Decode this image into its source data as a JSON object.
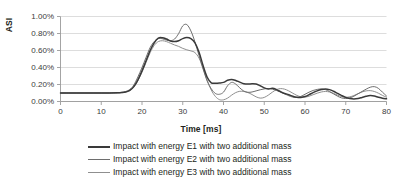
{
  "chart_data": {
    "type": "line",
    "title": "",
    "xlabel": "Time [ms]",
    "ylabel": "ASI",
    "xlim": [
      0,
      80
    ],
    "ylim": [
      0,
      0.01
    ],
    "xticks": [
      "0",
      "10",
      "20",
      "30",
      "40",
      "50",
      "60",
      "70",
      "80"
    ],
    "xtick_values": [
      0,
      10,
      20,
      30,
      40,
      50,
      60,
      70,
      80
    ],
    "yticks": [
      "0.00%",
      "0.20%",
      "0.40%",
      "0.60%",
      "0.80%",
      "1.00%"
    ],
    "ytick_values": [
      0.0,
      0.002,
      0.004,
      0.006,
      0.008,
      0.01
    ],
    "grid": "horizontal",
    "legend_position": "bottom",
    "x": [
      0,
      2,
      4,
      6,
      8,
      10,
      12,
      14,
      15,
      16,
      17,
      18,
      19,
      20,
      21,
      22,
      23,
      24,
      25,
      26,
      27,
      28,
      29,
      30,
      31,
      32,
      33,
      34,
      35,
      36,
      37,
      38,
      39,
      40,
      41,
      42,
      43,
      44,
      45,
      46,
      47,
      48,
      49,
      50,
      51,
      52,
      53,
      54,
      55,
      56,
      57,
      58,
      59,
      60,
      61,
      62,
      63,
      64,
      65,
      66,
      67,
      68,
      69,
      70,
      71,
      72,
      73,
      74,
      75,
      76,
      77,
      78,
      79,
      80
    ],
    "series": [
      {
        "name": "Impact with energy E1 with two additional mass",
        "color": "#3a3a3a",
        "values": [
          0.001,
          0.001,
          0.001,
          0.001,
          0.001,
          0.001,
          0.001,
          0.00102,
          0.00105,
          0.00112,
          0.0013,
          0.00175,
          0.00255,
          0.0036,
          0.0048,
          0.006,
          0.0069,
          0.00745,
          0.0075,
          0.00735,
          0.00712,
          0.00705,
          0.00715,
          0.0074,
          0.00752,
          0.0074,
          0.0069,
          0.0058,
          0.0042,
          0.00285,
          0.0022,
          0.00215,
          0.00218,
          0.00225,
          0.0025,
          0.0026,
          0.00248,
          0.00228,
          0.0021,
          0.00205,
          0.00208,
          0.00205,
          0.00185,
          0.0016,
          0.00148,
          0.00155,
          0.0014,
          0.00115,
          0.00095,
          0.0008,
          0.00062,
          0.0005,
          0.00048,
          0.00058,
          0.0008,
          0.00105,
          0.00125,
          0.0014,
          0.00148,
          0.0014,
          0.0012,
          0.00095,
          0.0007,
          0.00048,
          0.00035,
          0.0003,
          0.00035,
          0.00048,
          0.00062,
          0.0007,
          0.00065,
          0.0005,
          0.00038,
          0.00032
        ]
      },
      {
        "name": "Impact with energy E2 with two additional mass",
        "color": "#6e6e6e",
        "values": [
          0.001,
          0.001,
          0.001,
          0.001,
          0.001,
          0.001,
          0.001,
          0.00103,
          0.00108,
          0.00118,
          0.0014,
          0.00195,
          0.0029,
          0.004,
          0.0052,
          0.00635,
          0.00705,
          0.0074,
          0.00738,
          0.00722,
          0.00715,
          0.00735,
          0.008,
          0.0089,
          0.00905,
          0.0083,
          0.007,
          0.0054,
          0.0038,
          0.0024,
          0.0015,
          0.00095,
          0.00085,
          0.0011,
          0.00185,
          0.00225,
          0.00205,
          0.0016,
          0.00122,
          0.00108,
          0.00112,
          0.00125,
          0.00138,
          0.00148,
          0.00152,
          0.00145,
          0.0013,
          0.00112,
          0.0009,
          0.00068,
          0.00052,
          0.00048,
          0.0006,
          0.00085,
          0.0011,
          0.0013,
          0.00142,
          0.00148,
          0.0014,
          0.00118,
          0.0009,
          0.00062,
          0.00042,
          0.00035,
          0.00042,
          0.00062,
          0.0009,
          0.00118,
          0.00145,
          0.00168,
          0.00175,
          0.00155,
          0.0011,
          0.00065
        ]
      },
      {
        "name": "Impact with energy E3 with two additional mass",
        "color": "#8f8f8f",
        "values": [
          0.001,
          0.001,
          0.001,
          0.001,
          0.001,
          0.001,
          0.001,
          0.00101,
          0.00104,
          0.0011,
          0.00128,
          0.0017,
          0.00245,
          0.00345,
          0.0046,
          0.00575,
          0.0066,
          0.00705,
          0.00715,
          0.00705,
          0.00685,
          0.00665,
          0.00648,
          0.00625,
          0.00608,
          0.00595,
          0.00575,
          0.0051,
          0.0039,
          0.0025,
          0.00135,
          0.0006,
          0.00022,
          0.0002,
          0.0004,
          0.00075,
          0.00105,
          0.0012,
          0.00118,
          0.00105,
          0.00082,
          0.00055,
          0.0004,
          0.00048,
          0.00075,
          0.0011,
          0.0014,
          0.00152,
          0.00145,
          0.00125,
          0.00098,
          0.00072,
          0.00055,
          0.00052,
          0.00062,
          0.0008,
          0.00098,
          0.00112,
          0.00118,
          0.00112,
          0.00095,
          0.00075,
          0.00058,
          0.0005,
          0.00055,
          0.0007,
          0.00092,
          0.00112,
          0.00125,
          0.00128,
          0.00118,
          0.00098,
          0.00072,
          0.0005
        ]
      }
    ]
  },
  "axes": {
    "y_title": "ASI",
    "x_title": "Time [ms]"
  },
  "legend": {
    "items": [
      {
        "label": "Impact with energy E1 with two additional mass",
        "color": "#3a3a3a",
        "width": 2.2
      },
      {
        "label": "Impact with energy E2 with two additional mass",
        "color": "#6e6e6e",
        "width": 1.4
      },
      {
        "label": "Impact with energy E3 with two additional mass",
        "color": "#8f8f8f",
        "width": 1.4
      }
    ]
  }
}
